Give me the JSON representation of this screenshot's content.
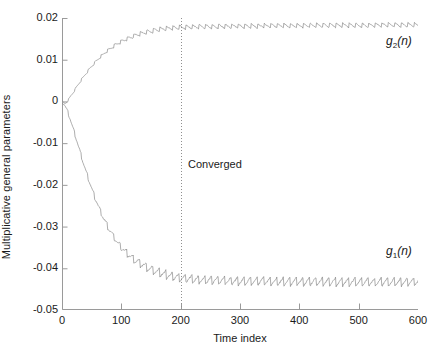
{
  "chart_data": {
    "type": "line",
    "title": "",
    "xlabel": "Time index",
    "ylabel": "Multiplicative general parameters",
    "xlim": [
      0,
      600
    ],
    "ylim": [
      -0.05,
      0.02
    ],
    "xticks": [
      0,
      100,
      200,
      300,
      400,
      500,
      600
    ],
    "yticks": [
      0.02,
      0.01,
      0,
      -0.01,
      -0.02,
      -0.03,
      -0.04,
      -0.05
    ],
    "xticklabels": [
      "0",
      "100",
      "200",
      "300",
      "400",
      "500",
      "600"
    ],
    "yticklabels": [
      "0.02",
      "0.01",
      "0",
      "-0.01",
      "-0.02",
      "-0.03",
      "-0.04",
      "-0.05"
    ],
    "grid": false,
    "legend": "none",
    "line_color": "#8a8a8a",
    "annotations": [
      {
        "name": "converged-marker",
        "text": "Converged",
        "x": 200,
        "y": -0.0155,
        "type": "text"
      },
      {
        "name": "convergence-line",
        "text": "",
        "x": 200,
        "type": "vline",
        "style": "dotted"
      },
      {
        "name": "g2-curve-label",
        "text": "g2(n)",
        "base": "g",
        "sub": "2",
        "arg": "(n)",
        "x": 520,
        "y": 0.0095
      },
      {
        "name": "g1-curve-label",
        "text": "g1(n)",
        "base": "g",
        "sub": "1",
        "arg": "(n)",
        "x": 520,
        "y": -0.0395
      }
    ],
    "series": [
      {
        "name": "g2(n)",
        "label": "g2(n)",
        "description": "Rises from 0 and saturates near 0.018 with small sawtooth ripple",
        "start_value": 0.0,
        "steady_state": 0.018,
        "ripple_amplitude": 0.0006,
        "x": [
          0,
          5,
          10,
          15,
          20,
          25,
          30,
          35,
          40,
          45,
          50,
          55,
          60,
          65,
          70,
          75,
          80,
          85,
          90,
          95,
          100,
          110,
          120,
          130,
          140,
          150,
          160,
          170,
          180,
          190,
          200,
          220,
          240,
          260,
          280,
          300,
          320,
          340,
          360,
          380,
          400,
          420,
          440,
          460,
          480,
          500,
          520,
          540,
          560,
          580,
          600
        ],
        "values": [
          0.0,
          -0.0006,
          0.0002,
          0.0013,
          0.0024,
          0.0035,
          0.0046,
          0.0056,
          0.0066,
          0.0075,
          0.0084,
          0.0092,
          0.01,
          0.0107,
          0.0113,
          0.0119,
          0.0125,
          0.013,
          0.0135,
          0.0139,
          0.0143,
          0.015,
          0.0156,
          0.0161,
          0.0165,
          0.0168,
          0.0171,
          0.0173,
          0.0175,
          0.0176,
          0.0177,
          0.0178,
          0.0179,
          0.0179,
          0.018,
          0.018,
          0.018,
          0.0181,
          0.0181,
          0.0181,
          0.0181,
          0.0182,
          0.0182,
          0.0182,
          0.0182,
          0.0182,
          0.0182,
          0.0183,
          0.0183,
          0.0183,
          0.0183
        ]
      },
      {
        "name": "g1(n)",
        "label": "g1(n)",
        "description": "Falls from 0 and settles near -0.0430 with sawtooth ripple",
        "start_value": 0.0,
        "steady_state": -0.043,
        "ripple_amplitude": 0.0011,
        "x": [
          0,
          5,
          10,
          15,
          20,
          25,
          30,
          35,
          40,
          45,
          50,
          55,
          60,
          65,
          70,
          75,
          80,
          85,
          90,
          95,
          100,
          110,
          120,
          130,
          140,
          150,
          160,
          170,
          180,
          190,
          200,
          220,
          240,
          260,
          280,
          300,
          320,
          340,
          360,
          380,
          400,
          420,
          440,
          460,
          480,
          500,
          520,
          540,
          560,
          580,
          600
        ],
        "values": [
          0.0,
          -0.001,
          -0.0026,
          -0.0047,
          -0.007,
          -0.0094,
          -0.0118,
          -0.0142,
          -0.0165,
          -0.0187,
          -0.0208,
          -0.0228,
          -0.0246,
          -0.0263,
          -0.0279,
          -0.0294,
          -0.0307,
          -0.0319,
          -0.033,
          -0.034,
          -0.0349,
          -0.0364,
          -0.0376,
          -0.0386,
          -0.0394,
          -0.0401,
          -0.0407,
          -0.0412,
          -0.0416,
          -0.0419,
          -0.0422,
          -0.0425,
          -0.0427,
          -0.0428,
          -0.0429,
          -0.043,
          -0.043,
          -0.043,
          -0.0431,
          -0.0431,
          -0.0431,
          -0.0431,
          -0.0431,
          -0.0432,
          -0.0432,
          -0.0432,
          -0.0432,
          -0.0432,
          -0.0432,
          -0.0432,
          -0.0432
        ]
      }
    ]
  }
}
